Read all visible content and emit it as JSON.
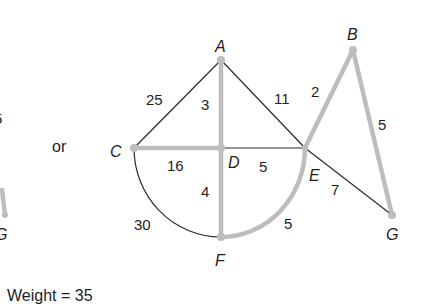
{
  "separator_text": "or",
  "caption": "Weight = 35",
  "left_fragment": {
    "vertex_label": "G",
    "weight_label": "5"
  },
  "colors": {
    "highlight": "#bdbdbd",
    "edge": "#2a2a2a",
    "text": "#1e1e1e"
  },
  "graph": {
    "vertices": [
      {
        "id": "A",
        "label": "A"
      },
      {
        "id": "B",
        "label": "B"
      },
      {
        "id": "C",
        "label": "C"
      },
      {
        "id": "D",
        "label": "D"
      },
      {
        "id": "E",
        "label": "E"
      },
      {
        "id": "F",
        "label": "F"
      },
      {
        "id": "G",
        "label": "G"
      }
    ],
    "edges": [
      {
        "from": "C",
        "to": "A",
        "weight": "25",
        "highlighted": false
      },
      {
        "from": "A",
        "to": "D",
        "weight": "3",
        "highlighted": true
      },
      {
        "from": "A",
        "to": "E",
        "weight": "11",
        "highlighted": false
      },
      {
        "from": "E",
        "to": "B",
        "weight": "2",
        "highlighted": true
      },
      {
        "from": "B",
        "to": "G",
        "weight": "5",
        "highlighted": true
      },
      {
        "from": "C",
        "to": "D",
        "weight": "16",
        "highlighted": true
      },
      {
        "from": "D",
        "to": "E",
        "weight": "5",
        "highlighted": false
      },
      {
        "from": "D",
        "to": "F",
        "weight": "4",
        "highlighted": true
      },
      {
        "from": "E",
        "to": "G",
        "weight": "7",
        "highlighted": false
      },
      {
        "from": "C",
        "to": "F",
        "weight": "30",
        "highlighted": false
      },
      {
        "from": "F",
        "to": "E",
        "weight": "5",
        "highlighted": true
      }
    ]
  }
}
